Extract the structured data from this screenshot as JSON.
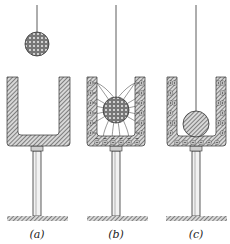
{
  "figure": {
    "colors": {
      "ink": "#333333",
      "hatch": "#555555",
      "background": "#ffffff"
    },
    "panels": [
      {
        "id": "a",
        "label": "(a)",
        "state": "ball suspended above can",
        "cup": {
          "x": 7,
          "y": 77,
          "w": 63,
          "h": 69,
          "wall": 11
        },
        "ball": {
          "cx": 37,
          "cy": 44,
          "r": 12,
          "fill": "charged-dots"
        },
        "string_top": 5,
        "stand": {
          "cx": 37,
          "collar_y": 146,
          "rod_bottom": 216,
          "base_x": 7,
          "base_w": 61
        },
        "charges": "none",
        "field_lines": false,
        "label_x": 37
      },
      {
        "id": "b",
        "label": "(b)",
        "state": "ball inside can, induced charges and field lines",
        "cup": {
          "x": 87,
          "y": 77,
          "w": 58,
          "h": 69,
          "wall": 10
        },
        "ball": {
          "cx": 116,
          "cy": 110,
          "r": 13,
          "fill": "charged-dots"
        },
        "string_top": 5,
        "stand": {
          "cx": 116,
          "collar_y": 146,
          "rod_bottom": 216,
          "base_x": 87,
          "base_w": 61
        },
        "charges": "plus-minus",
        "field_lines": true,
        "label_x": 116
      },
      {
        "id": "c",
        "label": "(c)",
        "state": "ball touches can bottom, charge transferred to outer surface",
        "cup": {
          "x": 167,
          "y": 77,
          "w": 59,
          "h": 69,
          "wall": 10
        },
        "ball": {
          "cx": 196,
          "cy": 124,
          "r": 13,
          "fill": "hatched-neutral"
        },
        "string_top": 5,
        "stand": {
          "cx": 196,
          "collar_y": 146,
          "rod_bottom": 216,
          "base_x": 166,
          "base_w": 61
        },
        "charges": "plus-outer",
        "field_lines": false,
        "label_x": 196
      }
    ]
  }
}
